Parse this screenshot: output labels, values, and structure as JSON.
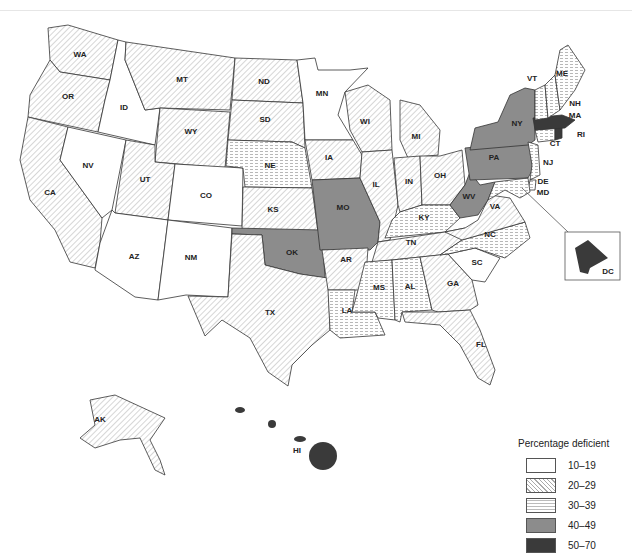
{
  "map": {
    "type": "choropleth",
    "region": "United States",
    "legend": {
      "title": "Percentage deficient",
      "categories": [
        {
          "label": "10–19",
          "fill": "white"
        },
        {
          "label": "20–29",
          "fill": "diagonal-hatch"
        },
        {
          "label": "30–39",
          "fill": "dashed-horizontal"
        },
        {
          "label": "40–49",
          "fill": "medium-gray"
        },
        {
          "label": "50–70",
          "fill": "dark-gray"
        }
      ],
      "colors": {
        "c0": "#ffffff",
        "c1": "#aaaaaa",
        "c2": "#bbbbbb",
        "c3": "#8c8c8c",
        "c4": "#3a3a3a"
      }
    },
    "states": {
      "WA": "20–29",
      "OR": "20–29",
      "CA": "20–29",
      "ID": "10–19",
      "NV": "10–19",
      "MT": "20–29",
      "WY": "20–29",
      "UT": "20–29",
      "AZ": "10–19",
      "CO": "10–19",
      "NM": "10–19",
      "ND": "20–29",
      "SD": "20–29",
      "NE": "30–39",
      "KS": "20–29",
      "OK": "40–49",
      "TX": "20–29",
      "MN": "10–19",
      "IA": "20–29",
      "MO": "40–49",
      "AR": "20–29",
      "LA": "30–39",
      "WI": "20–29",
      "IL": "20–29",
      "MI": "20–29",
      "IN": "20–29",
      "OH": "20–29",
      "KY": "30–39",
      "TN": "20–29",
      "MS": "30–39",
      "AL": "30–39",
      "GA": "20–29",
      "FL": "20–29",
      "SC": "10–19",
      "NC": "30–39",
      "VA": "20–29",
      "WV": "40–49",
      "PA": "40–49",
      "NY": "40–49",
      "NJ": "30–39",
      "DE": "30–39",
      "MD": "30–39",
      "CT": "30–39",
      "RI": "50–70",
      "MA": "50–70",
      "VT": "30–39",
      "NH": "30–39",
      "ME": "30–39",
      "AK": "20–29",
      "HI": "50–70",
      "DC": "50–70"
    },
    "labels": {
      "WA": "WA",
      "OR": "OR",
      "CA": "CA",
      "ID": "ID",
      "NV": "NV",
      "MT": "MT",
      "WY": "WY",
      "UT": "UT",
      "AZ": "AZ",
      "CO": "CO",
      "NM": "NM",
      "ND": "ND",
      "SD": "SD",
      "NE": "NE",
      "KS": "KS",
      "OK": "OK",
      "TX": "TX",
      "MN": "MN",
      "IA": "IA",
      "MO": "MO",
      "AR": "AR",
      "LA": "LA",
      "WI": "WI",
      "IL": "IL",
      "MI": "MI",
      "IN": "IN",
      "OH": "OH",
      "KY": "KY",
      "TN": "TN",
      "MS": "MS",
      "AL": "AL",
      "GA": "GA",
      "FL": "FL",
      "SC": "SC",
      "NC": "NC",
      "VA": "VA",
      "WV": "WV",
      "PA": "PA",
      "NY": "NY",
      "NJ": "NJ",
      "DE": "DE",
      "MD": "MD",
      "CT": "CT",
      "RI": "RI",
      "MA": "MA",
      "VT": "VT",
      "NH": "NH",
      "ME": "ME",
      "AK": "AK",
      "HI": "HI",
      "DC": "DC"
    }
  }
}
